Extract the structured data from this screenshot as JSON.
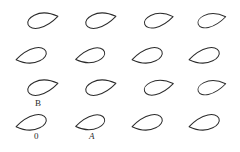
{
  "figure": {
    "background_color": "#ffffff",
    "stroke_color": "#2b2b2b",
    "width": 240,
    "height": 152,
    "rows": 4,
    "columns": 4
  },
  "chart_data": {
    "type": "scatter",
    "subtitle": "",
    "xlabel": "",
    "ylabel": "",
    "grid": false,
    "legend": "none",
    "xlim": [
      0,
      240
    ],
    "ylim": [
      0,
      152
    ],
    "shape_kind": "teardrop-airfoil-outline",
    "orientations": {
      "odd_rows_deg": 205,
      "even_rows_deg": 25
    },
    "series": [
      {
        "name": "row-1",
        "orientation": "tip-down-left",
        "values": [
          {
            "cx": 43,
            "cy": 21,
            "rot": 205,
            "scale": 1.0
          },
          {
            "cx": 101,
            "cy": 21,
            "rot": 205,
            "scale": 1.0
          },
          {
            "cx": 159,
            "cy": 21,
            "rot": 205,
            "scale": 0.95
          },
          {
            "cx": 212,
            "cy": 21,
            "rot": 205,
            "scale": 0.92
          }
        ]
      },
      {
        "name": "row-2",
        "orientation": "tip-down-right",
        "values": [
          {
            "cx": 31,
            "cy": 55,
            "rot": 25,
            "scale": 1.0
          },
          {
            "cx": 90,
            "cy": 55,
            "rot": 25,
            "scale": 0.96
          },
          {
            "cx": 147,
            "cy": 55,
            "rot": 25,
            "scale": 1.0
          },
          {
            "cx": 204,
            "cy": 55,
            "rot": 25,
            "scale": 1.0
          }
        ]
      },
      {
        "name": "row-3",
        "orientation": "tip-down-left",
        "values": [
          {
            "cx": 43,
            "cy": 88,
            "rot": 205,
            "scale": 1.0
          },
          {
            "cx": 101,
            "cy": 88,
            "rot": 205,
            "scale": 1.0
          },
          {
            "cx": 159,
            "cy": 88,
            "rot": 205,
            "scale": 0.96
          },
          {
            "cx": 212,
            "cy": 88,
            "rot": 205,
            "scale": 0.92
          }
        ]
      },
      {
        "name": "row-4",
        "orientation": "tip-down-right",
        "values": [
          {
            "cx": 31,
            "cy": 122,
            "rot": 25,
            "scale": 1.0
          },
          {
            "cx": 90,
            "cy": 122,
            "rot": 25,
            "scale": 0.96
          },
          {
            "cx": 147,
            "cy": 122,
            "rot": 25,
            "scale": 1.0
          },
          {
            "cx": 204,
            "cy": 122,
            "rot": 25,
            "scale": 1.0
          }
        ]
      }
    ],
    "annotations": [
      {
        "text": "B",
        "x": 38,
        "y": 103,
        "italic": false
      },
      {
        "text": "0",
        "x": 37,
        "y": 136,
        "italic": false
      },
      {
        "text": "A",
        "x": 92,
        "y": 137,
        "italic": true
      }
    ]
  },
  "labels": {
    "b": "B",
    "o": "0",
    "a": "A"
  }
}
